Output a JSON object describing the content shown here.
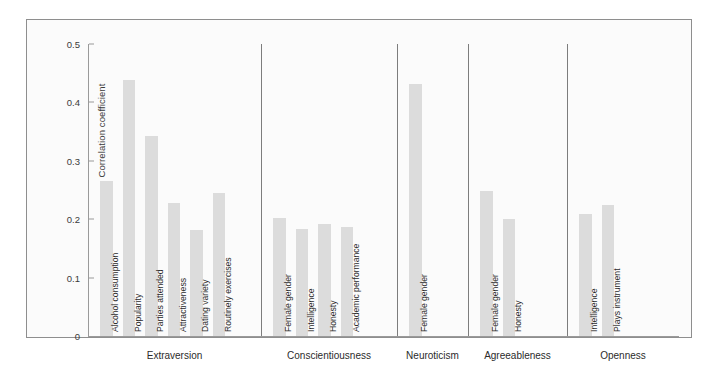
{
  "figure": {
    "background": "#fbfbfb",
    "border_color": "#8e8e8e",
    "bar_color": "#dcdcdc",
    "axis_color": "#9a9a9a"
  },
  "chart_data": {
    "type": "bar",
    "title": "",
    "xlabel": "",
    "ylabel": "Correlation coefficient",
    "ylim": [
      0,
      0.5
    ],
    "yticks": [
      "0",
      "0.1",
      "0.2",
      "0.3",
      "0.4",
      "0.5"
    ],
    "ytick_values": [
      0,
      0.1,
      0.2,
      0.3,
      0.4,
      0.5
    ],
    "grid": false,
    "legend": "none",
    "orientation": "vertical",
    "groups": [
      {
        "name": "Extraversion",
        "categories": [
          "Alcohol consumption",
          "Popularity",
          "Parties attended",
          "Attractiveness",
          "Dating variety",
          "Routinely exercises"
        ],
        "values": [
          0.265,
          0.438,
          0.343,
          0.228,
          0.182,
          0.245
        ]
      },
      {
        "name": "Conscientiousness",
        "categories": [
          "Female gender",
          "Intelligence",
          "Honesty",
          "Academic performance"
        ],
        "values": [
          0.202,
          0.184,
          0.191,
          0.187
        ]
      },
      {
        "name": "Neuroticism",
        "categories": [
          "Female gender"
        ],
        "values": [
          0.431
        ]
      },
      {
        "name": "Agreeableness",
        "categories": [
          "Female gender",
          "Honesty"
        ],
        "values": [
          0.248,
          0.2
        ]
      },
      {
        "name": "Openness",
        "categories": [
          "Intelligence",
          "Plays instrument"
        ],
        "values": [
          0.209,
          0.224
        ]
      }
    ]
  }
}
